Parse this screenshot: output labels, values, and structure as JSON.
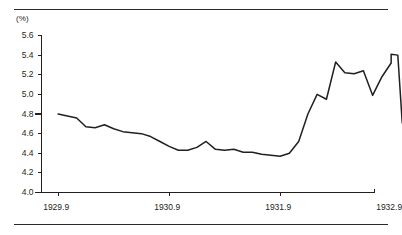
{
  "figure": {
    "unit_label": "(%)",
    "has_top_rule": true,
    "has_bottom_rule": true,
    "line_color": "#231f20",
    "axis_color": "#231f20",
    "background": "#ffffff"
  },
  "chart_data": {
    "type": "line",
    "title": "",
    "subtitle": "",
    "xlabel": "",
    "ylabel": "(%)",
    "ylim": [
      4.0,
      5.6
    ],
    "xlim": [
      1929.75,
      1932.75
    ],
    "grid": false,
    "legend": null,
    "yticks": [
      "5.6",
      "5.4",
      "5.2",
      "5.0",
      "4.8",
      "4.6",
      "4.4",
      "4.2",
      "4.0"
    ],
    "ytick_values": [
      5.6,
      5.4,
      5.2,
      5.0,
      4.8,
      4.6,
      4.4,
      4.2,
      4.0
    ],
    "xticks": [
      "1929.9",
      "1930.9",
      "1931.9",
      "1932.9"
    ],
    "xtick_values": [
      1929.9,
      1930.9,
      1931.9,
      1932.9
    ],
    "series": [
      {
        "name": "",
        "x": [
          1929.9,
          1929.983,
          1930.067,
          1930.15,
          1930.233,
          1930.317,
          1930.4,
          1930.483,
          1930.567,
          1930.65,
          1930.733,
          1930.817,
          1930.9,
          1930.983,
          1931.067,
          1931.15,
          1931.233,
          1931.317,
          1931.4,
          1931.483,
          1931.567,
          1931.65,
          1931.733,
          1931.817,
          1931.9,
          1931.983,
          1932.067,
          1932.15,
          1932.233,
          1932.317,
          1932.4,
          1932.483,
          1932.567,
          1932.65,
          1932.733,
          1932.817,
          1932.9
        ],
        "y": [
          4.8,
          4.78,
          4.76,
          4.67,
          4.66,
          4.69,
          4.65,
          4.62,
          4.61,
          4.6,
          4.57,
          4.52,
          4.47,
          4.43,
          4.43,
          4.46,
          4.52,
          4.44,
          4.43,
          4.44,
          4.41,
          4.41,
          4.39,
          4.38,
          4.37,
          4.4,
          4.52,
          4.8,
          5.0,
          4.95,
          5.33,
          5.22,
          5.21,
          5.24,
          4.99,
          5.18,
          5.32
        ]
      }
    ],
    "series_tail": {
      "x": [
        1932.9,
        1932.96,
        1933.0
      ],
      "y": [
        5.41,
        5.4,
        4.71
      ]
    }
  }
}
